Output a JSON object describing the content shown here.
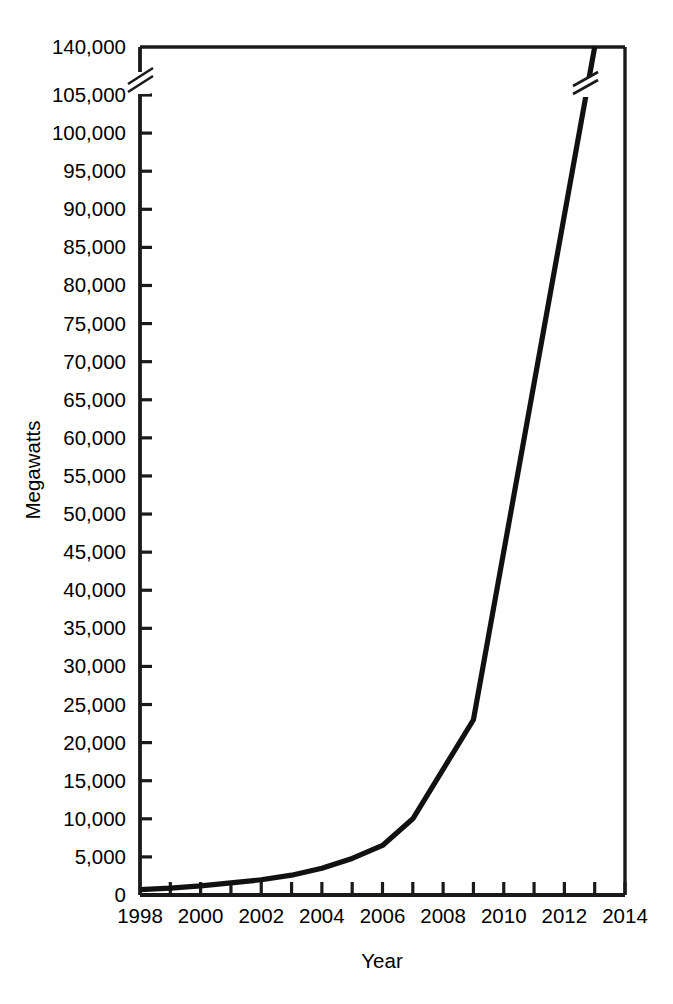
{
  "chart_data": {
    "type": "line",
    "title": "",
    "xlabel": "Year",
    "ylabel": "Megawatts",
    "x": [
      1998,
      1999,
      2000,
      2001,
      2002,
      2003,
      2004,
      2005,
      2006,
      2007,
      2009,
      2013
    ],
    "values": [
      700,
      900,
      1200,
      1600,
      2000,
      2600,
      3500,
      4800,
      6500,
      10000,
      23000,
      140000
    ],
    "series": [
      {
        "name": "Cumulative installed capacity",
        "values": [
          700,
          900,
          1200,
          1600,
          2000,
          2600,
          3500,
          4800,
          6500,
          10000,
          23000,
          140000
        ]
      }
    ],
    "xlim": [
      1998,
      2014
    ],
    "ylim": [
      0,
      140000
    ],
    "x_tick_labels": [
      "1998",
      "2000",
      "2002",
      "2004",
      "2006",
      "2008",
      "2010",
      "2012",
      "2014"
    ],
    "x_tick_values": [
      1998,
      2000,
      2002,
      2004,
      2006,
      2008,
      2010,
      2012,
      2014
    ],
    "x_minor_tick_values": [
      1999,
      2001,
      2003,
      2005,
      2007,
      2009,
      2011,
      2013
    ],
    "y_tick_labels": [
      "0",
      "5,000",
      "10,000",
      "15,000",
      "20,000",
      "25,000",
      "30,000",
      "35,000",
      "40,000",
      "45,000",
      "50,000",
      "55,000",
      "60,000",
      "65,000",
      "70,000",
      "75,000",
      "80,000",
      "85,000",
      "90,000",
      "95,000",
      "100,000",
      "105,000",
      "140,000"
    ],
    "y_tick_values": [
      0,
      5000,
      10000,
      15000,
      20000,
      25000,
      30000,
      35000,
      40000,
      45000,
      50000,
      55000,
      60000,
      65000,
      70000,
      75000,
      80000,
      85000,
      90000,
      95000,
      100000,
      105000,
      140000
    ],
    "y_axis_break": {
      "present": true,
      "below": 105000,
      "above": 140000,
      "note": "axis broken between 105,000 and 140,000"
    },
    "grid": false,
    "legend": null,
    "line_color": "#111111",
    "axis_color": "#1a1a1a",
    "background_color": "#ffffff"
  }
}
